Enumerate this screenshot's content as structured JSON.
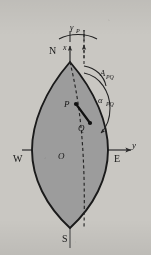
{
  "figure": {
    "background_color": "#c9c7c2",
    "body_fill_color": "#9c9c9c",
    "outline_color": "#1a1a1a",
    "axis_color": "#3a3a3a",
    "labels": {
      "north_pole": "N",
      "south_pole": "S",
      "west": "W",
      "east": "E",
      "origin": "O",
      "x_axis": "x",
      "y_axis": "y",
      "point_p": "P",
      "point_q": "Q",
      "azimuth": "A",
      "azimuth_sub": "PQ",
      "alpha": "α",
      "alpha_sub": "PQ",
      "gamma": "γ",
      "gamma_sub": "P"
    },
    "geometry": {
      "north_pole_point": [
        70,
        62
      ],
      "south_pole_point": [
        70,
        228
      ],
      "origin_point": [
        70,
        150
      ],
      "point_p": [
        76,
        104
      ],
      "point_q": [
        89,
        122
      ],
      "horizontal_axis_y": 150,
      "lens_half_width": 38,
      "y_arrow_tip": [
        131,
        150
      ],
      "x_arrow_tip": [
        70,
        47
      ]
    },
    "arcs": {
      "gamma_arc_label": "γP",
      "azimuth_arc_label": "APQ",
      "alpha_arc_label": "αPQ"
    }
  }
}
